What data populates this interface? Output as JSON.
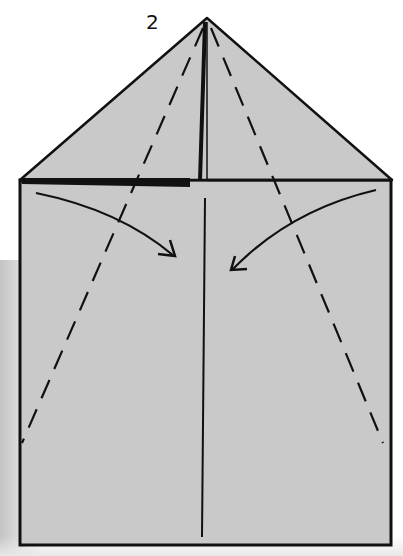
{
  "diagram": {
    "type": "origami-fold-step",
    "step_number": "2",
    "colors": {
      "paper": "#c9c9c9",
      "line": "#111111",
      "background": "#ffffff"
    },
    "elements": {
      "triangle_flap": "top triangle folded down",
      "square_body": "square paper base",
      "center_crease": "vertical center line",
      "valley_folds": [
        "left dashed fold line",
        "right dashed fold line"
      ],
      "arrows": [
        "left edge folds to center",
        "right edge folds to center"
      ]
    }
  }
}
